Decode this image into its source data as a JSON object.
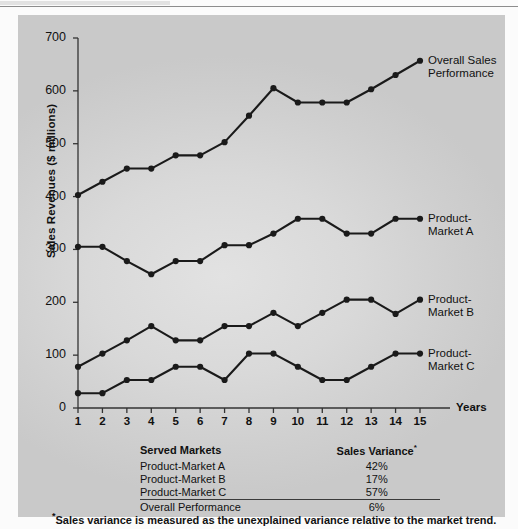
{
  "chart_data": {
    "type": "line",
    "title": "",
    "xlabel": "Years",
    "ylabel": "Sales Revenues ($ millions)",
    "x": [
      1,
      2,
      3,
      4,
      5,
      6,
      7,
      8,
      9,
      10,
      11,
      12,
      13,
      14,
      15
    ],
    "xtick_labels": [
      "1",
      "2",
      "3",
      "4",
      "5",
      "6",
      "7",
      "8",
      "9",
      "10",
      "11",
      "12",
      "13",
      "14",
      "15"
    ],
    "ytick_labels": [
      "0",
      "100",
      "200",
      "300",
      "400",
      "500",
      "600",
      "700"
    ],
    "yticks": [
      0,
      100,
      200,
      300,
      400,
      500,
      600,
      700
    ],
    "ylim": [
      0,
      700
    ],
    "xlim": [
      1,
      15
    ],
    "grid": false,
    "legend_position": "right-inline-labels",
    "marker": "filled-circle",
    "line_color": "#1a1a1a",
    "series": [
      {
        "name": "Overall Sales Performance",
        "label_lines": [
          "Overall Sales",
          "Performance"
        ],
        "values": [
          403,
          428,
          453,
          453,
          478,
          478,
          503,
          553,
          605,
          578,
          578,
          578,
          603,
          630,
          657
        ]
      },
      {
        "name": "Product-Market A",
        "label_lines": [
          "Product-",
          "Market A"
        ],
        "values": [
          305,
          305,
          278,
          253,
          278,
          278,
          308,
          308,
          330,
          358,
          358,
          330,
          330,
          358,
          358
        ]
      },
      {
        "name": "Product-Market B",
        "label_lines": [
          "Product-",
          "Market B"
        ],
        "values": [
          78,
          103,
          128,
          155,
          128,
          128,
          155,
          155,
          180,
          155,
          180,
          205,
          205,
          178,
          205
        ]
      },
      {
        "name": "Product-Market C",
        "label_lines": [
          "Product-",
          "Market C"
        ],
        "values": [
          28,
          28,
          53,
          53,
          78,
          78,
          53,
          103,
          103,
          78,
          53,
          53,
          78,
          103,
          103
        ]
      }
    ]
  },
  "table": {
    "headers": {
      "markets": "Served Markets",
      "variance": "Sales Variance"
    },
    "variance_header_superscript": "*",
    "rows": [
      {
        "market": "Product-Market A",
        "variance": "42%"
      },
      {
        "market": "Product-Market B",
        "variance": "17%"
      },
      {
        "market": "Product-Market C",
        "variance": "57%"
      },
      {
        "market": "Overall Performance",
        "variance": "6%"
      }
    ],
    "rule_after_row_index": 2
  },
  "footnote": {
    "marker": "*",
    "text": "Sales variance is measured as the unexplained variance relative to the market trend."
  },
  "colors": {
    "panel_light": "#e2e2e2",
    "panel_dark": "#c9c9c9",
    "ink": "#111111",
    "page": "#fbfbfb"
  }
}
